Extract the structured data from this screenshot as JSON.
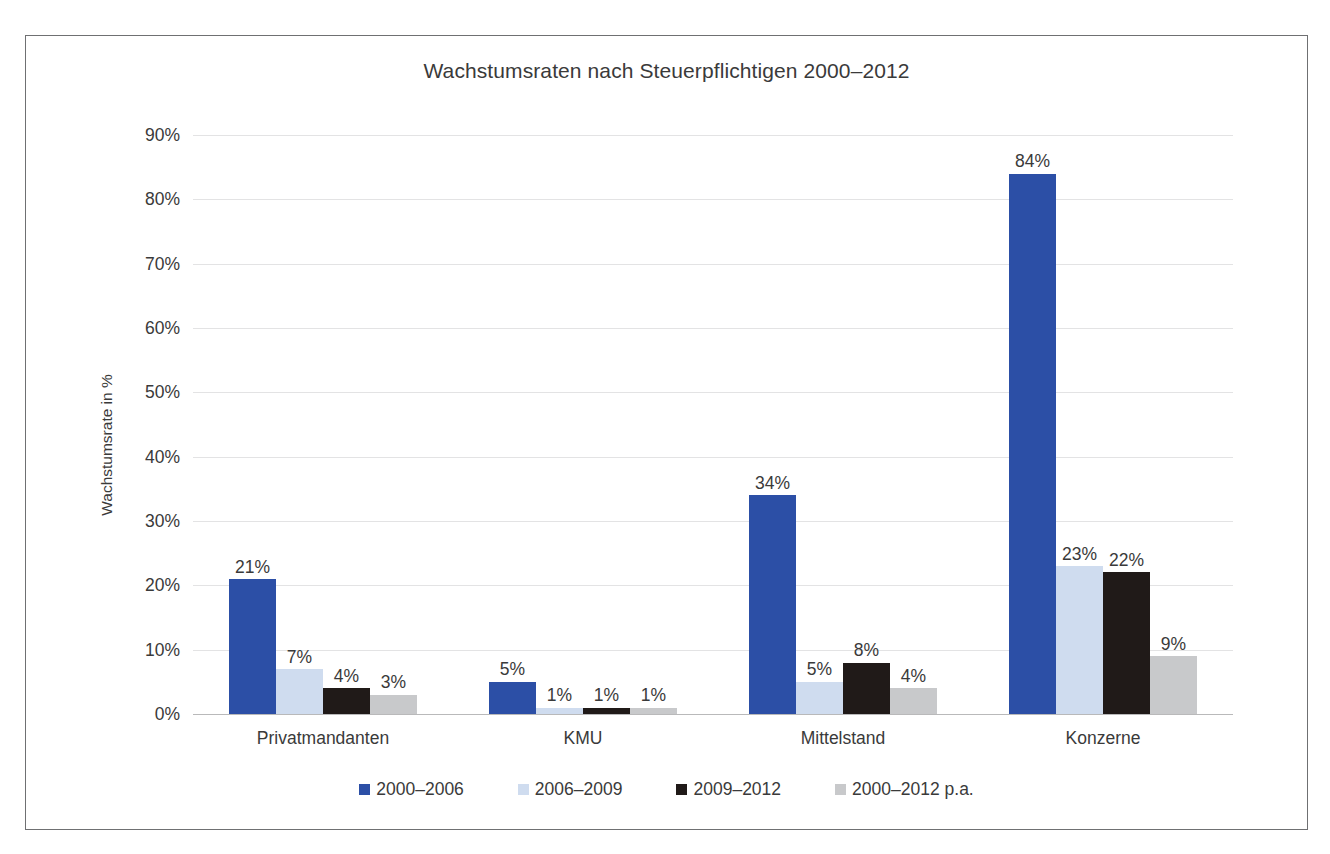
{
  "chart_data": {
    "type": "bar",
    "title": "Wachstumsraten nach Steuerpflichtigen 2000–2012",
    "xlabel": "",
    "ylabel": "Wachstumsrate in %",
    "categories": [
      "Privatmandanten",
      "KMU",
      "Mittelstand",
      "Konzerne"
    ],
    "series": [
      {
        "name": "2000–2006",
        "color": "#2c4fa6",
        "values": [
          21,
          5,
          34,
          84
        ],
        "labels": [
          "21%",
          "5%",
          "34%",
          "84%"
        ]
      },
      {
        "name": "2006–2009",
        "color": "#cfdcef",
        "values": [
          7,
          1,
          5,
          23
        ],
        "labels": [
          "7%",
          "1%",
          "5%",
          "23%"
        ]
      },
      {
        "name": "2009–2012",
        "color": "#201a18",
        "values": [
          4,
          1,
          8,
          22
        ],
        "labels": [
          "4%",
          "1%",
          "8%",
          "22%"
        ]
      },
      {
        "name": "2000–2012 p.a.",
        "color": "#c8c9cb",
        "values": [
          3,
          1,
          4,
          9
        ],
        "labels": [
          "3%",
          "1%",
          "4%",
          "9%"
        ]
      }
    ],
    "ylim": [
      0,
      90
    ],
    "yticks": [
      90,
      80,
      70,
      60,
      50,
      40,
      30,
      20,
      10,
      0
    ],
    "ytick_labels": [
      "90%",
      "80%",
      "70%",
      "60%",
      "50%",
      "40%",
      "30%",
      "20%",
      "10%",
      "0%"
    ],
    "grid": true,
    "legend_position": "bottom",
    "frame": true
  }
}
